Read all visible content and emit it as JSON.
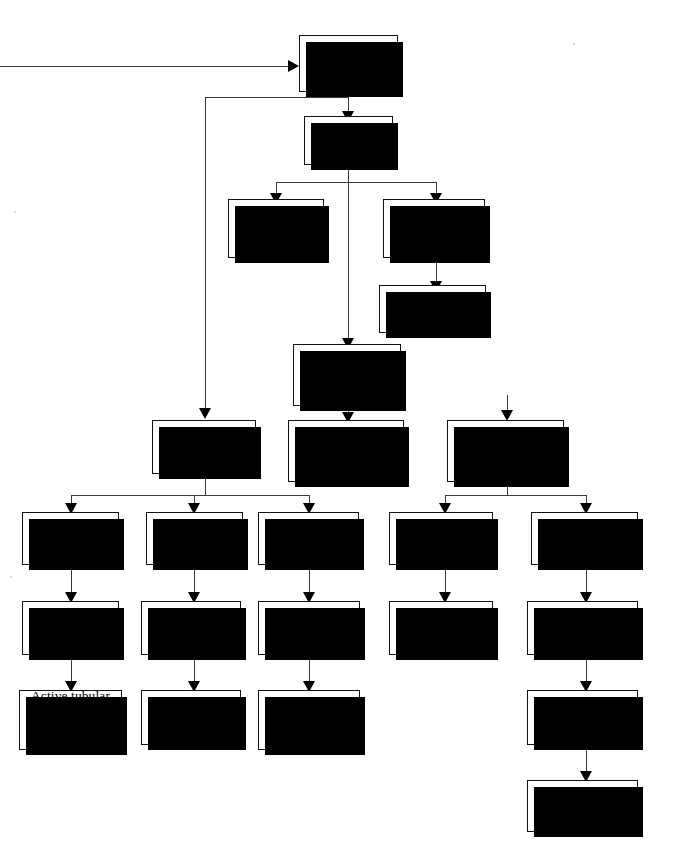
{
  "diagram": {
    "type": "flowchart",
    "nodes": [
      {
        "id": "signs",
        "label": "Signs of\nprogressive\ndeterioration"
      },
      {
        "id": "blood",
        "label": "Blood\nchanges"
      },
      {
        "id": "bun",
        "label": "Rising BUN\nand\ncreatinine"
      },
      {
        "id": "rbc",
        "label": "↓ RBC with\n↓ reticuloytes"
      },
      {
        "id": "epo",
        "label": "Erythropoietin\ndeficiency"
      },
      {
        "id": "cr",
        "label": "Decreasing 1/Cr\npredicts rate\nof change"
      },
      {
        "id": "urine",
        "label": "Urine\nchanges"
      },
      {
        "id": "graphing",
        "label": "Graphing permits\nevaluating results\nof therapy"
      },
      {
        "id": "combined",
        "label": "Combined urine\nand blood\nparameters"
      },
      {
        "id": "casts",
        "label": "Casts, cells"
      },
      {
        "id": "ggt",
        "label": "↑ GGT:Cr\nratio"
      },
      {
        "id": "protein",
        "label": "↑ Protein:Cr\nratio"
      },
      {
        "id": "fena",
        "label": "↑ FeNa"
      },
      {
        "id": "fep",
        "label": "↑ FeP"
      },
      {
        "id": "sediment",
        "label": "Active urine\nsediment"
      },
      {
        "id": "enzymuria",
        "label": "Enzymuria"
      },
      {
        "id": "proteinuria",
        "label": "Proteinuria"
      },
      {
        "id": "tubdamage",
        "label": "Active tubular\ndamage"
      },
      {
        "id": "suggests",
        "label": "Suggests\n↑ parathormone"
      },
      {
        "id": "tubglom",
        "label": "Active tubular or\nglomerular\ndamage"
      },
      {
        "id": "necrosis",
        "label": "Active tubular\nnecrosis"
      },
      {
        "id": "lesion",
        "label": "Active\nglomerular\nlesion"
      },
      {
        "id": "pth",
        "label": "↑ Parathormone"
      },
      {
        "id": "hyperpara",
        "label": "Hyperpara-\nthyroidism"
      }
    ],
    "colors": {
      "box_fill": "#ffffff",
      "box_border": "#111111",
      "shadow": "#000000",
      "connector": "#3a3a3a",
      "text": "#000000"
    }
  }
}
